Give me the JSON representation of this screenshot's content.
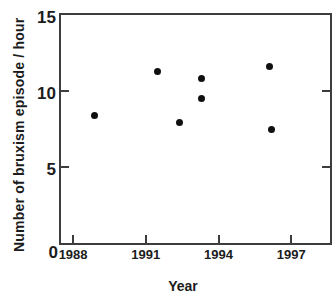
{
  "colors": {
    "background": "#ffffff",
    "axis": "#3d3d3d",
    "text": "#1c1c1c",
    "point": "#101010"
  },
  "chart_data": {
    "type": "scatter",
    "title": "",
    "xlabel": "Year",
    "ylabel": "Number of bruxism episode / hour",
    "xlim": [
      1987.5,
      1998.6
    ],
    "ylim": [
      0,
      15
    ],
    "x_ticks": [
      1988,
      1991,
      1994,
      1997
    ],
    "y_ticks": [
      0,
      5,
      10,
      15
    ],
    "grid": false,
    "legend": "none",
    "marker": "filled-circle",
    "points": [
      {
        "x": 1988.9,
        "y": 8.4
      },
      {
        "x": 1991.5,
        "y": 11.3
      },
      {
        "x": 1992.4,
        "y": 7.9
      },
      {
        "x": 1993.3,
        "y": 10.8
      },
      {
        "x": 1993.3,
        "y": 9.5
      },
      {
        "x": 1996.1,
        "y": 11.6
      },
      {
        "x": 1996.2,
        "y": 7.5
      }
    ]
  }
}
